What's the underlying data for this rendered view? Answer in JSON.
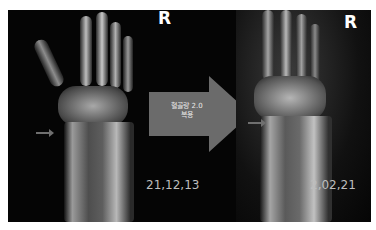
{
  "figure": {
    "panel_background": "#050505",
    "left_image": {
      "description": "wrist x-ray before treatment",
      "side_label": "R",
      "date": "21,12,13"
    },
    "right_image": {
      "description": "wrist x-ray after treatment",
      "side_label": "R",
      "date": "2,02,21"
    },
    "center_arrow": {
      "color": "#6b6b6b",
      "text_line1": "혈골량 2.0",
      "text_line2": "복용"
    }
  }
}
